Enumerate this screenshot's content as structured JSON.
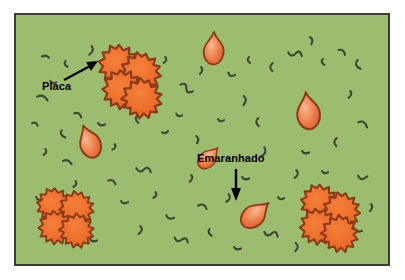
{
  "figure": {
    "background_color": "#ffffff",
    "panel": {
      "background_color": "#9cbd70",
      "border_color": "#3c3c32",
      "x": 14,
      "y": 13,
      "width": 376,
      "height": 253
    }
  },
  "labels": [
    {
      "id": "placa",
      "text": "Placa",
      "color": "#000000",
      "x": 42,
      "y": 81,
      "arrow": {
        "from_x": 62,
        "from_y": 78,
        "to_x": 94,
        "to_y": 62,
        "color": "#000000"
      }
    },
    {
      "id": "emaranhado",
      "text": "Emaranhado",
      "color": "#000000",
      "x": 197,
      "y": 153,
      "arrow": {
        "from_x": 234,
        "from_y": 167,
        "to_x": 234,
        "to_y": 195,
        "color": "#000000"
      }
    }
  ],
  "legend_keys": {
    "plaque_name": "Placa",
    "tangle_name": "Emaranhado",
    "thread_name": "filamento"
  },
  "colors": {
    "panel_green": "#9cbd70",
    "panel_border": "#3c3c32",
    "plaque_fill": "#eb6424",
    "plaque_fill_light": "#f08a4b",
    "plaque_outline": "#8a3a18",
    "tangle_fill": "#e8673c",
    "tangle_fill_light": "#f6a878",
    "tangle_outline": "#8a3a18",
    "thread": "#3f4436",
    "label_text": "#000000"
  },
  "plaques": [
    {
      "id": "plaque-top-left",
      "cx": 126,
      "cy": 75,
      "scale": 1.0,
      "blob_count": 4
    },
    {
      "id": "plaque-bottom-left",
      "cx": 61,
      "cy": 212,
      "scale": 0.86,
      "blob_count": 4
    },
    {
      "id": "plaque-bottom-right",
      "cx": 325,
      "cy": 212,
      "scale": 0.92,
      "blob_count": 4
    }
  ],
  "tangles": [
    {
      "id": "tangle-top-center",
      "cx": 212,
      "cy": 50,
      "scale": 1.0,
      "rotation": 0
    },
    {
      "id": "tangle-mid-left",
      "cx": 89,
      "cy": 143,
      "scale": 1.0,
      "rotation": -22
    },
    {
      "id": "tangle-mid-right",
      "cx": 307,
      "cy": 113,
      "scale": 1.1,
      "rotation": -8
    },
    {
      "id": "tangle-center-small",
      "cx": 205,
      "cy": 158,
      "scale": 0.78,
      "rotation": 42
    },
    {
      "id": "tangle-bottom-center",
      "cx": 251,
      "cy": 215,
      "scale": 1.0,
      "rotation": 48
    }
  ],
  "threads": [
    {
      "x": 40,
      "y": 55,
      "len": 9,
      "rot": 10
    },
    {
      "x": 61,
      "y": 62,
      "len": 7,
      "rot": 80
    },
    {
      "x": 85,
      "y": 48,
      "len": 11,
      "rot": 100
    },
    {
      "x": 48,
      "y": 80,
      "len": 8,
      "rot": 25
    },
    {
      "x": 35,
      "y": 96,
      "len": 13,
      "rot": 15
    },
    {
      "x": 40,
      "y": 150,
      "len": 7,
      "rot": 95
    },
    {
      "x": 57,
      "y": 132,
      "len": 9,
      "rot": 70
    },
    {
      "x": 61,
      "y": 160,
      "len": 10,
      "rot": 15
    },
    {
      "x": 96,
      "y": 122,
      "len": 8,
      "rot": 20
    },
    {
      "x": 109,
      "y": 145,
      "len": 7,
      "rot": 105
    },
    {
      "x": 132,
      "y": 117,
      "len": 8,
      "rot": 85
    },
    {
      "x": 150,
      "y": 100,
      "len": 9,
      "rot": 30
    },
    {
      "x": 160,
      "y": 130,
      "len": 7,
      "rot": 0
    },
    {
      "x": 178,
      "y": 85,
      "len": 14,
      "rot": 20
    },
    {
      "x": 174,
      "y": 113,
      "len": 7,
      "rot": 25
    },
    {
      "x": 192,
      "y": 137,
      "len": 8,
      "rot": 75
    },
    {
      "x": 134,
      "y": 168,
      "len": 13,
      "rot": 15
    },
    {
      "x": 106,
      "y": 180,
      "len": 9,
      "rot": 20
    },
    {
      "x": 119,
      "y": 200,
      "len": 8,
      "rot": 15
    },
    {
      "x": 150,
      "y": 193,
      "len": 7,
      "rot": 100
    },
    {
      "x": 164,
      "y": 215,
      "len": 9,
      "rot": 25
    },
    {
      "x": 186,
      "y": 176,
      "len": 8,
      "rot": 95
    },
    {
      "x": 196,
      "y": 205,
      "len": 10,
      "rot": 15
    },
    {
      "x": 172,
      "y": 238,
      "len": 11,
      "rot": 25
    },
    {
      "x": 205,
      "y": 230,
      "len": 8,
      "rot": 80
    },
    {
      "x": 222,
      "y": 196,
      "len": 9,
      "rot": 100
    },
    {
      "x": 240,
      "y": 176,
      "len": 8,
      "rot": 20
    },
    {
      "x": 256,
      "y": 150,
      "len": 12,
      "rot": 105
    },
    {
      "x": 252,
      "y": 120,
      "len": 9,
      "rot": 95
    },
    {
      "x": 238,
      "y": 98,
      "len": 10,
      "rot": 85
    },
    {
      "x": 216,
      "y": 118,
      "len": 7,
      "rot": 20
    },
    {
      "x": 196,
      "y": 68,
      "len": 8,
      "rot": 90
    },
    {
      "x": 266,
      "y": 65,
      "len": 9,
      "rot": 100
    },
    {
      "x": 286,
      "y": 52,
      "len": 13,
      "rot": 15
    },
    {
      "x": 306,
      "y": 38,
      "len": 8,
      "rot": 70
    },
    {
      "x": 318,
      "y": 60,
      "len": 7,
      "rot": 85
    },
    {
      "x": 336,
      "y": 50,
      "len": 9,
      "rot": 30
    },
    {
      "x": 352,
      "y": 62,
      "len": 10,
      "rot": 85
    },
    {
      "x": 345,
      "y": 92,
      "len": 8,
      "rot": 95
    },
    {
      "x": 356,
      "y": 122,
      "len": 12,
      "rot": 20
    },
    {
      "x": 330,
      "y": 140,
      "len": 9,
      "rot": 100
    },
    {
      "x": 300,
      "y": 150,
      "len": 8,
      "rot": 20
    },
    {
      "x": 290,
      "y": 172,
      "len": 9,
      "rot": 95
    },
    {
      "x": 276,
      "y": 196,
      "len": 7,
      "rot": 20
    },
    {
      "x": 262,
      "y": 232,
      "len": 12,
      "rot": 20
    },
    {
      "x": 290,
      "y": 245,
      "len": 9,
      "rot": 85
    },
    {
      "x": 356,
      "y": 175,
      "len": 11,
      "rot": 15
    },
    {
      "x": 366,
      "y": 205,
      "len": 8,
      "rot": 90
    },
    {
      "x": 352,
      "y": 228,
      "len": 9,
      "rot": 25
    },
    {
      "x": 232,
      "y": 246,
      "len": 8,
      "rot": 20
    },
    {
      "x": 134,
      "y": 228,
      "len": 9,
      "rot": 95
    },
    {
      "x": 88,
      "y": 238,
      "len": 8,
      "rot": 20
    },
    {
      "x": 70,
      "y": 182,
      "len": 7,
      "rot": 100
    },
    {
      "x": 34,
      "y": 196,
      "len": 8,
      "rot": 20
    },
    {
      "x": 30,
      "y": 122,
      "len": 7,
      "rot": 15
    },
    {
      "x": 226,
      "y": 72,
      "len": 8,
      "rot": 25
    },
    {
      "x": 160,
      "y": 58,
      "len": 7,
      "rot": 95
    },
    {
      "x": 110,
      "y": 100,
      "len": 8,
      "rot": 20
    },
    {
      "x": 208,
      "y": 36,
      "len": 7,
      "rot": 100
    },
    {
      "x": 320,
      "y": 170,
      "len": 7,
      "rot": 20
    }
  ]
}
